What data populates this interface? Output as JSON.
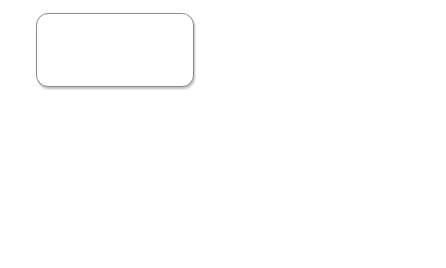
{
  "annual": {
    "label": "Cycle: Annual",
    "develop_box": "Develop Platform PoR & Capital Plan",
    "bullets": [
      "deployment plan",
      "Engineering Rules",
      "Util. Targets"
    ],
    "por_box": "Plan Of Record (PoR)",
    "dollar_icon": "$",
    "allocated_capital": "Allocated Capital"
  },
  "continuous": {
    "label": "Cycle: Continuos",
    "sections": [
      {
        "title": "Build PoR  Capacity  (Governance: Platform KPIs, Process Metrics/Backlog",
        "steps": [
          "Monitor Consumption",
          "Apply Eng. rules",
          "Incr. Capacity Required",
          "Review PoR for tech Direction",
          "Asset Recov. & Reuse oppty?",
          "Capital Avail.?",
          "Deploy Capacity"
        ]
      },
      {
        "title": "Build \"Success Based\" Capacity  (Gov:   Biz Case)",
        "steps": [
          "Success based Lead",
          "Biz Case",
          "Review Sol. Against tech Dir.",
          "Review Gate 1 & 2",
          "Post Sale Optimization",
          "Capital Avail.?",
          "Deploy Capacity"
        ]
      },
      {
        "title": "Build to Customer Commitments (Gov: Leading/lagging, Safety stock level, held orders)",
        "steps": [
          "Orders",
          "Review Load/Lag orders",
          "Plan Remedial capacity action",
          "SS update? capacity add?",
          "Asset Recov. & Reuse oppty?",
          "Capital Avail.?",
          "Deploy Capacity"
        ]
      }
    ]
  }
}
